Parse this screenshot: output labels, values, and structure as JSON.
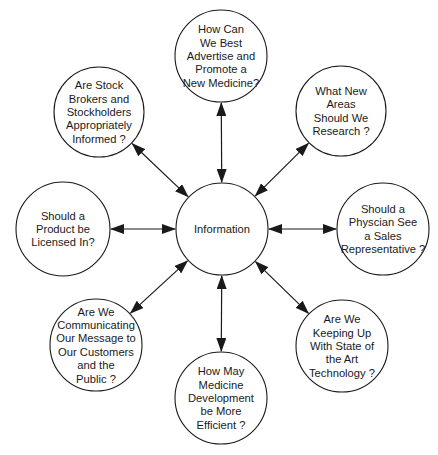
{
  "diagram": {
    "type": "hub-and-spoke",
    "colors": {
      "stroke": "#1a1a1a",
      "fill": "#ffffff",
      "background": "#ffffff"
    },
    "center": {
      "id": "information",
      "label": [
        "Information"
      ],
      "cx": 222,
      "cy": 229,
      "r": 46
    },
    "nodes": [
      {
        "id": "advertise",
        "label": [
          "How Can",
          "We Best",
          "Advertise and",
          "Promote a",
          "New Medicine?"
        ],
        "cx": 221,
        "cy": 56,
        "r": 46
      },
      {
        "id": "research",
        "label": [
          "What New",
          "Areas",
          "Should We",
          "Research ?"
        ],
        "cx": 341,
        "cy": 111,
        "r": 45
      },
      {
        "id": "physician",
        "label": [
          "Should a",
          "Physcian See",
          "a Sales",
          "Representative ?"
        ],
        "cx": 383,
        "cy": 229,
        "r": 46
      },
      {
        "id": "technology",
        "label": [
          "Are We",
          "Keeping Up",
          "With State of",
          "the Art",
          "Technology ?"
        ],
        "cx": 342,
        "cy": 346,
        "r": 46
      },
      {
        "id": "development",
        "label": [
          "How May",
          "Medicine",
          "Development",
          "be More",
          "Efficient ?"
        ],
        "cx": 221,
        "cy": 398,
        "r": 46
      },
      {
        "id": "communicating",
        "label": [
          "Are We",
          "Communicating",
          "Our Message to",
          "Our Customers",
          "and the",
          "Public ?"
        ],
        "cx": 96,
        "cy": 345,
        "r": 46
      },
      {
        "id": "licensed",
        "label": [
          "Should a",
          "Product be",
          "Licensed In?"
        ],
        "cx": 63,
        "cy": 229,
        "r": 47
      },
      {
        "id": "stockholders",
        "label": [
          "Are Stock",
          "Brokers and",
          "Stockholders",
          "Appropriately",
          "Informed ?"
        ],
        "cx": 99,
        "cy": 112,
        "r": 45
      }
    ],
    "edges": [
      {
        "from": "information",
        "to": "advertise",
        "arrows": "both"
      },
      {
        "from": "information",
        "to": "research",
        "arrows": "both"
      },
      {
        "from": "information",
        "to": "physician",
        "arrows": "both"
      },
      {
        "from": "information",
        "to": "technology",
        "arrows": "both"
      },
      {
        "from": "information",
        "to": "development",
        "arrows": "both"
      },
      {
        "from": "information",
        "to": "communicating",
        "arrows": "both"
      },
      {
        "from": "information",
        "to": "licensed",
        "arrows": "both"
      },
      {
        "from": "information",
        "to": "stockholders",
        "arrows": "both"
      }
    ]
  }
}
